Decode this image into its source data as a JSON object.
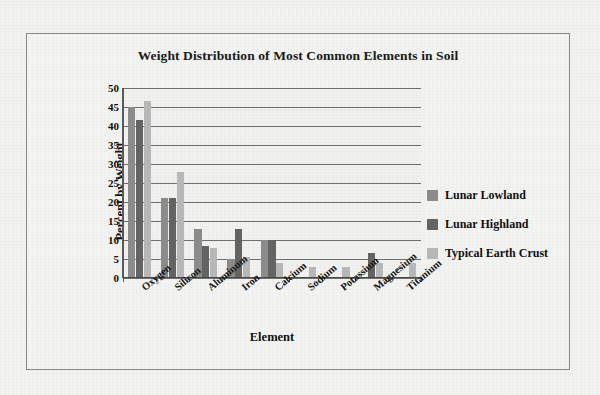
{
  "chart_data": {
    "type": "bar",
    "title": "Weight Distribution of Most Common Elements in Soil",
    "xlabel": "Element",
    "ylabel": "Percent by Weight",
    "ylim": [
      0,
      50
    ],
    "ytick_step": 5,
    "yticks": [
      50,
      45,
      40,
      35,
      30,
      25,
      20,
      15,
      10,
      5,
      0
    ],
    "grid": true,
    "legend_position": "right",
    "categories": [
      "Oxygen",
      "Silicon",
      "Aluminum",
      "Iron",
      "Calcium",
      "Sodium",
      "Potassium",
      "Magnesium",
      "Titanium"
    ],
    "series": [
      {
        "name": "Lunar Lowland",
        "color": "#8c8c8c",
        "values": [
          45,
          21,
          13,
          5,
          10,
          0,
          0,
          0,
          0
        ]
      },
      {
        "name": "Lunar Highland",
        "color": "#646464",
        "values": [
          41.5,
          21,
          8.5,
          13,
          10,
          0,
          0,
          6.5,
          0
        ]
      },
      {
        "name": "Typical Earth Crust",
        "color": "#b8b8b8",
        "values": [
          46.5,
          28,
          8,
          5.5,
          4,
          3,
          3,
          4,
          4
        ]
      }
    ]
  },
  "legend": {
    "items": [
      {
        "label": "Lunar Lowland"
      },
      {
        "label": "Lunar Highland"
      },
      {
        "label": "Typical Earth Crust"
      }
    ]
  }
}
